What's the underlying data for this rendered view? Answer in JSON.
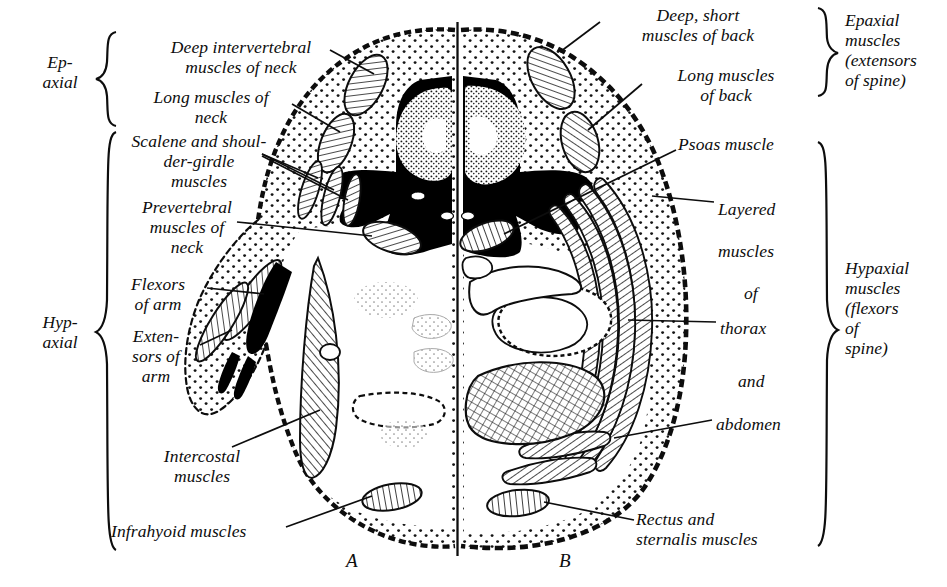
{
  "figure": {
    "type": "anatomical-cross-section",
    "panels": [
      {
        "id": "A",
        "label": "A",
        "x": 350,
        "y": 556
      },
      {
        "id": "B",
        "label": "B",
        "x": 562,
        "y": 556
      }
    ]
  },
  "left_groups": [
    {
      "name": "epaxial",
      "label": "Ep-\naxial",
      "x": 18,
      "y": 58,
      "width": 84,
      "brace_top": 30,
      "brace_bottom": 126
    },
    {
      "name": "hypaxial",
      "label": "Hyp-\naxial",
      "x": 18,
      "y": 318,
      "width": 84,
      "brace_top": 130,
      "brace_bottom": 551
    }
  ],
  "right_groups": [
    {
      "name": "epaxial",
      "label": "Epaxial\nmuscles\n(extensors\nof spine)",
      "x": 843,
      "y": 12,
      "brace_top": 6,
      "brace_bottom": 96
    },
    {
      "name": "hypaxial",
      "label": "Hypaxial\nmuscles\n(flexors\nof\nspine)",
      "x": 843,
      "y": 264,
      "brace_top": 140,
      "brace_bottom": 546
    }
  ],
  "left_labels": [
    {
      "name": "deep-intervertebral-muscles-of-neck",
      "text": "Deep intervertebral\nmuscles of neck",
      "x": 138,
      "y": 40,
      "align": "left",
      "width": 208
    },
    {
      "name": "long-muscles-of-neck",
      "text": "Long muscles of\nneck",
      "x": 122,
      "y": 90,
      "align": "left",
      "width": 180
    },
    {
      "name": "scalene-and-shoulder-girdle-muscles",
      "text": "Scalene and shoul-\nder-girdle\nmuscles",
      "x": 108,
      "y": 134,
      "align": "left",
      "width": 185
    },
    {
      "name": "prevertebral-muscles-of-neck",
      "text": "Prevertebral\nmuscles of\nneck",
      "x": 112,
      "y": 200,
      "align": "left",
      "width": 150
    },
    {
      "name": "flexors-of-arm",
      "text": "Flexors\nof arm",
      "x": 110,
      "y": 277,
      "align": "left",
      "width": 100
    },
    {
      "name": "extensors-of-arm",
      "text": "Exten-\nsors of\narm",
      "x": 112,
      "y": 330,
      "align": "left",
      "width": 94
    },
    {
      "name": "intercostal-muscles",
      "text": "Intercostal\nmuscles",
      "x": 138,
      "y": 450,
      "align": "left",
      "width": 130
    },
    {
      "name": "infrahyoid-muscles",
      "text": "Infrahyoid muscles",
      "x": 113,
      "y": 524,
      "align": "left",
      "width": 200
    }
  ],
  "right_labels": [
    {
      "name": "deep-short-muscles-of-back",
      "text": "Deep, short\nmuscles of back",
      "x": 603,
      "y": 8,
      "align": "left",
      "width": 190
    },
    {
      "name": "long-muscles-of-back",
      "text": "Long muscles\nof back",
      "x": 645,
      "y": 68,
      "align": "left",
      "width": 160
    },
    {
      "name": "psoas-muscle",
      "text": "Psoas muscle",
      "x": 680,
      "y": 137,
      "align": "left",
      "width": 150
    },
    {
      "name": "layered-muscles-of-thorax-and-abdomen",
      "lines": [
        {
          "text": "Layered",
          "x": 720,
          "y": 208
        },
        {
          "text": "muscles",
          "x": 720,
          "y": 250
        },
        {
          "text": "of",
          "x": 745,
          "y": 292
        },
        {
          "text": "thorax",
          "x": 722,
          "y": 327
        },
        {
          "text": "and",
          "x": 740,
          "y": 380
        },
        {
          "text": "abdomen",
          "x": 718,
          "y": 423
        }
      ]
    },
    {
      "name": "rectus-and-sternalis-muscles",
      "text": "Rectus and\nsternalis muscles",
      "x": 638,
      "y": 512,
      "align": "left",
      "width": 200
    }
  ],
  "colors": {
    "ink": "#0d0d0d",
    "paper": "#ffffff",
    "stipple": "#1a1a1a",
    "bone_fill": "#000000"
  }
}
